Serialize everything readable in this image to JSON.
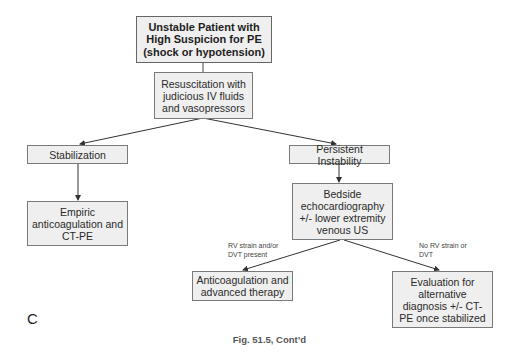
{
  "diagram": {
    "type": "flowchart",
    "panel_letter": "C",
    "caption": "Fig. 51.5, Cont’d",
    "nodes": {
      "start": {
        "label": "Unstable Patient with High Suspicion for PE (shock or hypotension)"
      },
      "resuscitation": {
        "label": "Resuscitation with judicious IV fluids and vasopressors"
      },
      "stabilization": {
        "label": "Stabilization"
      },
      "persistent_instability": {
        "label": "Persistent Instability"
      },
      "empiric": {
        "label": "Empiric anticoagulation and CT-PE"
      },
      "bedside_echo": {
        "label": "Bedside echocardiography +/- lower extremity venous US"
      },
      "anticoag_advanced": {
        "label": "Anticoagulation and advanced therapy"
      },
      "evaluation_alt": {
        "label": "Evaluation for alternative diagnosis +/- CT-PE once stabilized"
      }
    },
    "edge_labels": {
      "rv_strain_present": "RV strain and/or DVT present",
      "no_rv_strain": "No RV strain or DVT"
    },
    "edges": [
      {
        "from": "start",
        "to": "resuscitation",
        "label": ""
      },
      {
        "from": "resuscitation",
        "to": "stabilization",
        "label": ""
      },
      {
        "from": "resuscitation",
        "to": "persistent_instability",
        "label": ""
      },
      {
        "from": "stabilization",
        "to": "empiric",
        "label": ""
      },
      {
        "from": "persistent_instability",
        "to": "bedside_echo",
        "label": ""
      },
      {
        "from": "bedside_echo",
        "to": "anticoag_advanced",
        "label": "RV strain and/or DVT present"
      },
      {
        "from": "bedside_echo",
        "to": "evaluation_alt",
        "label": "No RV strain or DVT"
      }
    ],
    "colors": {
      "node_fill": "#efefef",
      "node_border": "#7a7a7a",
      "edge": "#333333"
    }
  }
}
